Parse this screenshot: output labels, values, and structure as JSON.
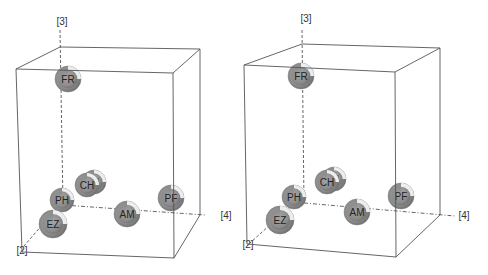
{
  "chart_data": [
    {
      "type": "scatter",
      "subtype": "3d-scatter-spheres",
      "title": "",
      "axes": {
        "x": "[4]",
        "y": "[3]",
        "z": "[2]"
      },
      "box": {
        "front": [
          [
            16,
            69
          ],
          [
            173,
            73
          ],
          [
            174,
            258
          ],
          [
            22,
            252
          ]
        ],
        "back": [
          [
            60,
            47
          ],
          [
            200,
            49
          ],
          [
            200,
            215
          ],
          [
            60,
            210
          ]
        ]
      },
      "axis_lines": {
        "vertical": {
          "from": [
            60,
            30
          ],
          "to": [
            63,
            205
          ],
          "label": "[3]",
          "label_pos": [
            62,
            25
          ]
        },
        "horizontal": {
          "from": [
            63,
            205
          ],
          "to": [
            205,
            215
          ],
          "label": "[4]",
          "label_pos": [
            226,
            219
          ]
        },
        "depth": {
          "from": [
            55,
            210
          ],
          "to": [
            24,
            246
          ],
          "label": "[2]",
          "label_pos": [
            22,
            254
          ]
        }
      },
      "points": [
        {
          "label": "FR",
          "cx": 68,
          "cy": 79,
          "r": 13
        },
        {
          "label": "IN",
          "cx": 94,
          "cy": 182,
          "r": 12
        },
        {
          "label": "CH",
          "cx": 87,
          "cy": 185,
          "r": 12
        },
        {
          "label": "PH",
          "cx": 62,
          "cy": 200,
          "r": 12
        },
        {
          "label": "PF",
          "cx": 171,
          "cy": 198,
          "r": 13
        },
        {
          "label": "AM",
          "cx": 127,
          "cy": 214,
          "r": 13
        },
        {
          "label": "EZ",
          "cx": 53,
          "cy": 224,
          "r": 14
        }
      ]
    },
    {
      "type": "scatter",
      "subtype": "3d-scatter-spheres",
      "title": "",
      "axes": {
        "x": "[4]",
        "y": "[3]",
        "z": "[2]"
      },
      "box": {
        "front": [
          [
            244,
            65
          ],
          [
            395,
            72
          ],
          [
            396,
            257
          ],
          [
            247,
            244
          ]
        ],
        "back": [
          [
            302,
            44
          ],
          [
            440,
            48
          ],
          [
            440,
            215
          ],
          [
            302,
            205
          ]
        ]
      },
      "axis_lines": {
        "vertical": {
          "from": [
            302,
            30
          ],
          "to": [
            304,
            203
          ],
          "label": "[3]",
          "label_pos": [
            306,
            22
          ]
        },
        "horizontal": {
          "from": [
            304,
            203
          ],
          "to": [
            455,
            216
          ],
          "label": "[4]",
          "label_pos": [
            464,
            219
          ]
        },
        "depth": {
          "from": [
            292,
            205
          ],
          "to": [
            250,
            243
          ],
          "label": "[2]",
          "label_pos": [
            248,
            248
          ]
        }
      },
      "points": [
        {
          "label": "FR",
          "cx": 301,
          "cy": 76,
          "r": 13
        },
        {
          "label": "IN",
          "cx": 334,
          "cy": 179,
          "r": 12
        },
        {
          "label": "CH",
          "cx": 327,
          "cy": 182,
          "r": 12
        },
        {
          "label": "PH",
          "cx": 294,
          "cy": 197,
          "r": 12
        },
        {
          "label": "PF",
          "cx": 401,
          "cy": 196,
          "r": 13
        },
        {
          "label": "AM",
          "cx": 357,
          "cy": 212,
          "r": 13
        },
        {
          "label": "EZ",
          "cx": 280,
          "cy": 220,
          "r": 14
        }
      ]
    }
  ],
  "style": {
    "sphere_fill": "#8f8f8f",
    "sphere_shade": "#6e6e6e",
    "highlight": "#ffffff",
    "box_stroke": "#555555",
    "axis_stroke": "#555555"
  }
}
